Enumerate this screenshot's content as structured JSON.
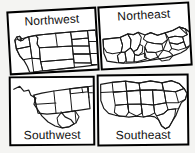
{
  "figure": {
    "background_color": "#f4f4f2",
    "border_color": "#000000",
    "map_line_color": "#1a1a1a",
    "panel_fill": "#ffffff"
  },
  "panels": [
    {
      "id": "northwest",
      "label": "Northwest",
      "label_position": "top",
      "row": "top",
      "column": "left",
      "map_subject": "united-states-northwest-region"
    },
    {
      "id": "northeast",
      "label": "Northeast",
      "label_position": "top",
      "row": "top",
      "column": "right",
      "map_subject": "united-states-northeast-region"
    },
    {
      "id": "southwest",
      "label": "Southwest",
      "label_position": "bottom",
      "row": "bottom",
      "column": "left",
      "map_subject": "united-states-southwest-region"
    },
    {
      "id": "southeast",
      "label": "Southeast",
      "label_position": "bottom",
      "row": "bottom",
      "column": "right",
      "map_subject": "united-states-southeast-region"
    }
  ]
}
